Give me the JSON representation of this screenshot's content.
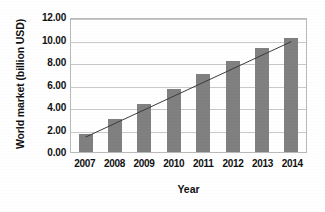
{
  "chart_data": {
    "type": "bar",
    "title": "",
    "subtitle": "",
    "xlabel": "Year",
    "ylabel": "World market (billion USD)",
    "categories": [
      "2007",
      "2008",
      "2009",
      "2010",
      "2011",
      "2012",
      "2013",
      "2014"
    ],
    "values": [
      1.6,
      2.9,
      4.3,
      5.6,
      6.9,
      8.1,
      9.25,
      10.1
    ],
    "series": [
      {
        "name": "World market",
        "type": "bar",
        "values": [
          1.6,
          2.9,
          4.3,
          5.6,
          6.9,
          8.1,
          9.25,
          10.1
        ],
        "color": "#808080"
      },
      {
        "name": "Linear trend",
        "type": "line",
        "values": [
          1.35,
          2.58,
          3.81,
          5.04,
          6.27,
          7.5,
          8.73,
          9.96
        ],
        "color": "#3a3a3a"
      }
    ],
    "ylim": [
      0,
      12
    ],
    "ytick_step": 2,
    "ytick_labels": [
      "0.00",
      "2.00",
      "4.00",
      "6.00",
      "8.00",
      "10.00",
      "12.00"
    ],
    "ytick_values": [
      0,
      2,
      4,
      6,
      8,
      10,
      12
    ],
    "grid": true,
    "grid_axis": "y",
    "legend": false,
    "legend_position": "none",
    "annotations": [],
    "colors": {
      "bar": "#808080",
      "trendline": "#3a3a3a",
      "gridline": "#c9c9c9",
      "plot_border": "#b9b9b9",
      "text": "#111111",
      "background": "#ffffff"
    }
  }
}
